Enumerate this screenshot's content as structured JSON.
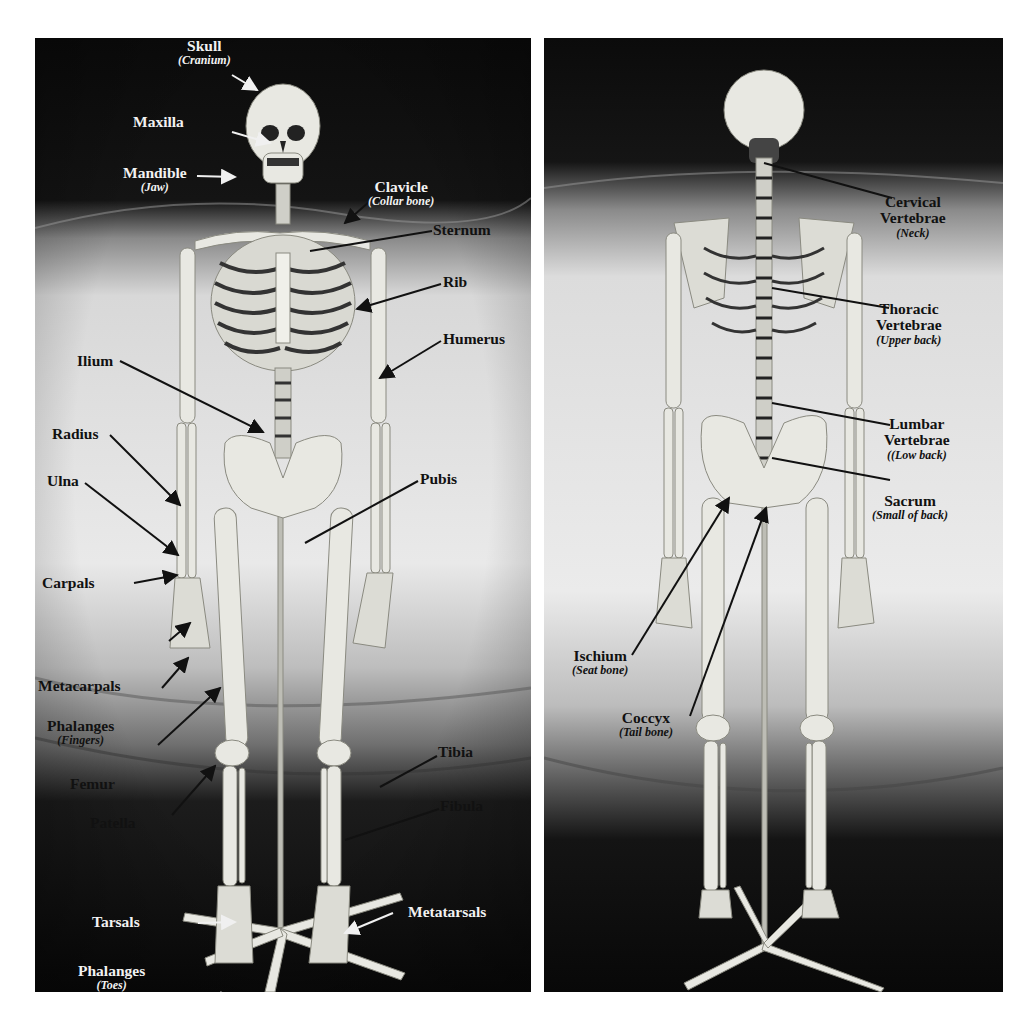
{
  "figure": {
    "left_panel": {
      "view": "anterior",
      "labels": [
        {
          "id": "skull",
          "main": "Skull",
          "sub": "(Cranium)"
        },
        {
          "id": "maxilla",
          "main": "Maxilla",
          "sub": ""
        },
        {
          "id": "mandible",
          "main": "Mandible",
          "sub": "(Jaw)"
        },
        {
          "id": "clavicle",
          "main": "Clavicle",
          "sub": "(Collar bone)"
        },
        {
          "id": "sternum",
          "main": "Sternum",
          "sub": ""
        },
        {
          "id": "rib",
          "main": "Rib",
          "sub": ""
        },
        {
          "id": "humerus",
          "main": "Humerus",
          "sub": ""
        },
        {
          "id": "ilium",
          "main": "Ilium",
          "sub": ""
        },
        {
          "id": "radius",
          "main": "Radius",
          "sub": ""
        },
        {
          "id": "ulna",
          "main": "Ulna",
          "sub": ""
        },
        {
          "id": "pubis",
          "main": "Pubis",
          "sub": ""
        },
        {
          "id": "carpals",
          "main": "Carpals",
          "sub": ""
        },
        {
          "id": "metacarpals",
          "main": "Metacarpals",
          "sub": ""
        },
        {
          "id": "phalanges-fingers",
          "main": "Phalanges",
          "sub": "(Fingers)"
        },
        {
          "id": "femur",
          "main": "Femur",
          "sub": ""
        },
        {
          "id": "patella",
          "main": "Patella",
          "sub": ""
        },
        {
          "id": "tibia",
          "main": "Tibia",
          "sub": ""
        },
        {
          "id": "fibula",
          "main": "Fibula",
          "sub": ""
        },
        {
          "id": "tarsals",
          "main": "Tarsals",
          "sub": ""
        },
        {
          "id": "metatarsals",
          "main": "Metatarsals",
          "sub": ""
        },
        {
          "id": "phalanges-toes",
          "main": "Phalanges",
          "sub": "(Toes)"
        }
      ]
    },
    "right_panel": {
      "view": "posterior",
      "labels": [
        {
          "id": "cervical",
          "main": "Cervical",
          "main2": "Vertebrae",
          "sub": "(Neck)"
        },
        {
          "id": "thoracic",
          "main": "Thoracic",
          "main2": "Vertebrae",
          "sub": "(Upper back)"
        },
        {
          "id": "lumbar",
          "main": "Lumbar",
          "main2": "Vertebrae",
          "sub": "((Low back)"
        },
        {
          "id": "sacrum",
          "main": "Sacrum",
          "main2": "",
          "sub": "(Small of back)"
        },
        {
          "id": "ischium",
          "main": "Ischium",
          "main2": "",
          "sub": "(Seat bone)"
        },
        {
          "id": "coccyx",
          "main": "Coccyx",
          "main2": "",
          "sub": "(Tail bone)"
        }
      ]
    },
    "colors": {
      "backdrop_dark": "#0c0c0c",
      "cloth_light": "#e6e6e6",
      "bone": "#e8e8e2",
      "label_light": "#f2f2f2",
      "label_dark": "#111111"
    }
  }
}
